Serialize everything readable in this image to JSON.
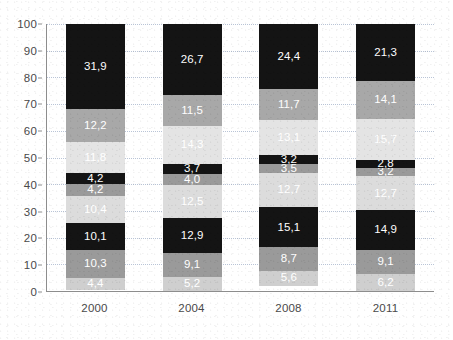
{
  "chart_data": {
    "type": "bar",
    "stacked": true,
    "title": "",
    "subtitle": "",
    "xlabel": "",
    "ylabel": "",
    "categories": [
      "2000",
      "2004",
      "2008",
      "2011"
    ],
    "ylim": [
      0,
      100
    ],
    "ytick_labels": [
      "0",
      "10",
      "20",
      "30",
      "40",
      "50",
      "60",
      "70",
      "80",
      "90",
      "100"
    ],
    "ytick_values": [
      0,
      10,
      20,
      30,
      40,
      50,
      60,
      70,
      80,
      90,
      100
    ],
    "grid": true,
    "legend": "none",
    "decimal_separator": ",",
    "series": [
      {
        "name": "segment-1",
        "color": "#cfcfcf",
        "label_color": "#ffffff",
        "values": [
          4.4,
          5.2,
          5.6,
          6.2
        ],
        "labels": [
          "4,4",
          "5,2",
          "5,6",
          "6,2"
        ]
      },
      {
        "name": "segment-2",
        "color": "#9a9a9a",
        "label_color": "#ffffff",
        "values": [
          10.3,
          9.1,
          8.7,
          9.1
        ],
        "labels": [
          "10,3",
          "9,1",
          "8,7",
          "9,1"
        ]
      },
      {
        "name": "segment-3",
        "color": "#141414",
        "label_color": "#ffffff",
        "values": [
          10.1,
          12.9,
          15.1,
          14.9
        ],
        "labels": [
          "10,1",
          "12,9",
          "15,1",
          "14,9"
        ]
      },
      {
        "name": "segment-4",
        "color": "#dcdcdc",
        "label_color": "#ffffff",
        "values": [
          10.4,
          12.5,
          12.7,
          12.7
        ],
        "labels": [
          "10,4",
          "12,5",
          "12,7",
          "12,7"
        ]
      },
      {
        "name": "segment-5",
        "color": "#9a9a9a",
        "label_color": "#ffffff",
        "values": [
          4.2,
          4.0,
          3.5,
          3.2
        ],
        "labels": [
          "4,2",
          "4,0",
          "3,5",
          "3,2"
        ]
      },
      {
        "name": "segment-6",
        "color": "#141414",
        "label_color": "#ffffff",
        "values": [
          4.2,
          3.7,
          3.2,
          2.8
        ],
        "labels": [
          "4,2",
          "3,7",
          "3,2",
          "2,8"
        ]
      },
      {
        "name": "segment-7",
        "color": "#e4e4e4",
        "label_color": "#ffffff",
        "values": [
          11.8,
          14.3,
          13.1,
          15.7
        ],
        "labels": [
          "11,8",
          "14,3",
          "13,1",
          "15,7"
        ]
      },
      {
        "name": "segment-8",
        "color": "#a8a8a8",
        "label_color": "#ffffff",
        "values": [
          12.2,
          11.5,
          11.7,
          14.1
        ],
        "labels": [
          "12,2",
          "11,5",
          "11,7",
          "14,1"
        ]
      },
      {
        "name": "segment-9",
        "color": "#141414",
        "label_color": "#ffffff",
        "values": [
          31.9,
          26.7,
          24.4,
          21.3
        ],
        "labels": [
          "31,9",
          "26,7",
          "24,4",
          "21,3"
        ]
      }
    ]
  }
}
